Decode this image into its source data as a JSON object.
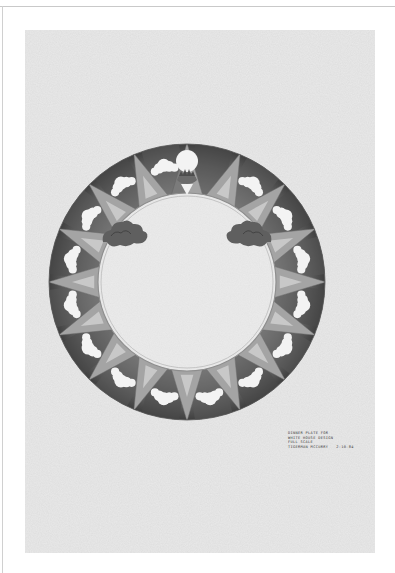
{
  "document": {
    "type": "architectural drawing",
    "subject": "dinner plate design",
    "colors": {
      "paper": "#e9e9e9",
      "graphite_dark": "#4a4a4a",
      "graphite_mid": "#8a8a8a",
      "graphite_light": "#b8b8b8",
      "cloud": "#f4f4f4",
      "frame": "#c9c9c9"
    }
  },
  "plate": {
    "motifs": [
      "sun-crest",
      "sun-rays",
      "clouds",
      "storm-clouds"
    ],
    "ray_count": 16
  },
  "caption": {
    "line1": "Dinner plate for",
    "line2": "White House design",
    "line3": "Full scale",
    "line4_author": "Tigerman McCurry",
    "line4_date": "2-10-84"
  }
}
